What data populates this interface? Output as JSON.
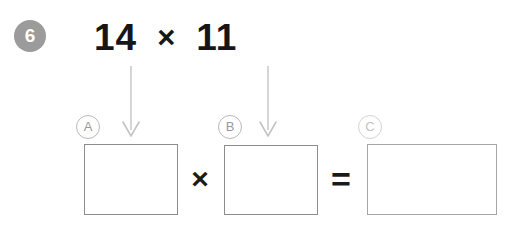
{
  "worksheet": {
    "question_number": "6",
    "background_color": "#ffffff",
    "badge_color": "#9b9b9b",
    "box_border_color": "#8d8d8d",
    "arrow_color": "#c4c4c4",
    "label_color": "#9a9a9a"
  },
  "equation": {
    "left_operand": "14",
    "operator": "×",
    "right_operand": "11"
  },
  "arrows": [
    {
      "name": "arrow-to-box-a",
      "points_to": "A"
    },
    {
      "name": "arrow-to-box-b",
      "points_to": "B"
    }
  ],
  "answer_row": {
    "labels": [
      {
        "id": "A",
        "text": "A"
      },
      {
        "id": "B",
        "text": "B"
      },
      {
        "id": "C",
        "text": "C"
      }
    ],
    "boxes": [
      {
        "id": "A",
        "value": ""
      },
      {
        "id": "B",
        "value": ""
      },
      {
        "id": "C",
        "value": ""
      }
    ],
    "operators": {
      "multiply": "×",
      "equals": "="
    }
  }
}
